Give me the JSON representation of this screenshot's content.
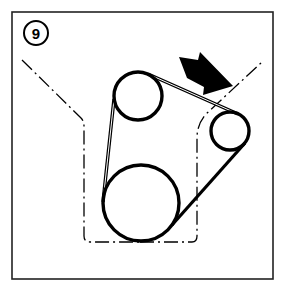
{
  "diagram": {
    "step_badge": {
      "label": "9"
    },
    "colors": {
      "ink": "#000000",
      "paper": "#ffffff",
      "frame": "#222222"
    },
    "frame": {
      "x": 12,
      "y": 12,
      "w": 261,
      "h": 267
    },
    "pulleys": [
      {
        "id": "upper-pulley",
        "cx": 138,
        "cy": 96,
        "r": 24
      },
      {
        "id": "tensioner-pulley",
        "cx": 230,
        "cy": 131,
        "r": 19
      },
      {
        "id": "crankshaft-pulley",
        "cx": 141,
        "cy": 203,
        "r": 38
      }
    ],
    "arrow": {
      "meaning": "belt tension check point",
      "direction": "down-right"
    },
    "engine_outline": {
      "style": "dash-dot"
    }
  }
}
